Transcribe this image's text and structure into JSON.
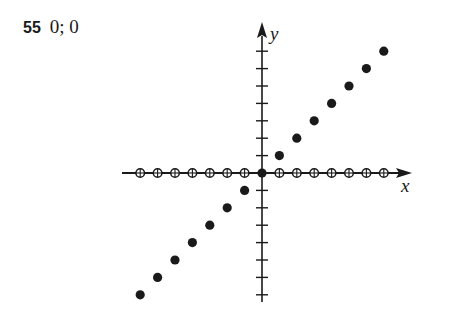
{
  "problem": {
    "number": "55",
    "answer": "0; 0"
  },
  "chart_data": {
    "type": "scatter",
    "title": "",
    "xlabel": "x",
    "ylabel": "y",
    "xlim": [
      -7,
      7
    ],
    "ylim": [
      -7,
      7
    ],
    "grid": false,
    "tick_spacing": 1,
    "series": [
      {
        "name": "filled points (y = x)",
        "marker": "filled-circle",
        "x": [
          -7,
          -6,
          -5,
          -4,
          -3,
          -2,
          -1,
          0,
          1,
          2,
          3,
          4,
          5,
          6,
          7
        ],
        "y": [
          -7,
          -6,
          -5,
          -4,
          -3,
          -2,
          -1,
          0,
          1,
          2,
          3,
          4,
          5,
          6,
          7
        ]
      },
      {
        "name": "open points on x-axis",
        "marker": "open-circle",
        "x": [
          -7,
          -6,
          -5,
          -4,
          -3,
          -2,
          -1,
          1,
          2,
          3,
          4,
          5,
          6,
          7
        ],
        "y": [
          0,
          0,
          0,
          0,
          0,
          0,
          0,
          0,
          0,
          0,
          0,
          0,
          0,
          0
        ]
      }
    ]
  },
  "colors": {
    "ink": "#1a1a1a",
    "background": "#ffffff"
  }
}
